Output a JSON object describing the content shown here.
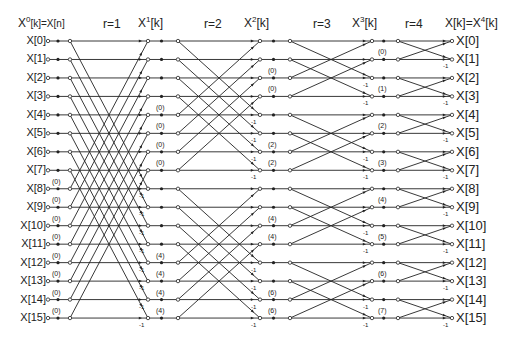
{
  "header": {
    "input_title_main": "X",
    "input_title_sup": "0",
    "input_title_rest": "[k]=X[n]",
    "stage_labels": [
      "r=1",
      "r=2",
      "r=3",
      "r=4"
    ],
    "intermediate_titles": [
      {
        "base": "X",
        "sup": "1",
        "rest": "[k]"
      },
      {
        "base": "X",
        "sup": "2",
        "rest": "[k]"
      },
      {
        "base": "X",
        "sup": "3",
        "rest": "[k]"
      }
    ],
    "output_title_main": "X[k]=X",
    "output_title_sup": "4",
    "output_title_rest": "[k]"
  },
  "inputs": [
    "X[0]",
    "X[1]",
    "X[2]",
    "X[3]",
    "X[4]",
    "X[5]",
    "X[6]",
    "X[7]",
    "X[8]",
    "X[9]",
    "X[10]",
    "X[11]",
    "X[12]",
    "X[13]",
    "X[14]",
    "X[15]"
  ],
  "outputs": [
    "X[0]",
    "X[1]",
    "X[2]",
    "X[3]",
    "X[4]",
    "X[5]",
    "X[6]",
    "X[7]",
    "X[8]",
    "X[9]",
    "X[10]",
    "X[11]",
    "X[12]",
    "X[13]",
    "X[14]",
    "X[15]"
  ],
  "twiddles": {
    "stage1": [
      {
        "row": 8,
        "label": "(0)"
      },
      {
        "row": 9,
        "label": "(0)"
      },
      {
        "row": 10,
        "label": "(0)"
      },
      {
        "row": 11,
        "label": "(0)"
      },
      {
        "row": 12,
        "label": "(0)"
      },
      {
        "row": 13,
        "label": "(0)"
      },
      {
        "row": 14,
        "label": "(0)"
      },
      {
        "row": 15,
        "label": "(0)"
      }
    ],
    "stage2": [
      {
        "row": 4,
        "label": "(0)"
      },
      {
        "row": 5,
        "label": "(0)"
      },
      {
        "row": 6,
        "label": "(0)"
      },
      {
        "row": 7,
        "label": "(0)"
      },
      {
        "row": 12,
        "label": "(4)"
      },
      {
        "row": 13,
        "label": "(4)"
      },
      {
        "row": 14,
        "label": "(4)"
      },
      {
        "row": 15,
        "label": "(4)"
      }
    ],
    "stage3": [
      {
        "row": 2,
        "label": "(0)"
      },
      {
        "row": 3,
        "label": "(0)"
      },
      {
        "row": 6,
        "label": "(2)"
      },
      {
        "row": 7,
        "label": "(2)"
      },
      {
        "row": 10,
        "label": "(4)"
      },
      {
        "row": 11,
        "label": "(4)"
      },
      {
        "row": 14,
        "label": "(6)"
      },
      {
        "row": 15,
        "label": "(6)"
      }
    ],
    "stage4": [
      {
        "row": 1,
        "label": "(0)"
      },
      {
        "row": 3,
        "label": "(1)"
      },
      {
        "row": 5,
        "label": "(2)"
      },
      {
        "row": 7,
        "label": "(3)"
      },
      {
        "row": 9,
        "label": "(4)"
      },
      {
        "row": 11,
        "label": "(5)"
      },
      {
        "row": 13,
        "label": "(6)"
      },
      {
        "row": 15,
        "label": "(7)"
      }
    ]
  },
  "minus_one_label": "-1",
  "colors": {
    "line": "#222222",
    "background": "#ffffff"
  }
}
